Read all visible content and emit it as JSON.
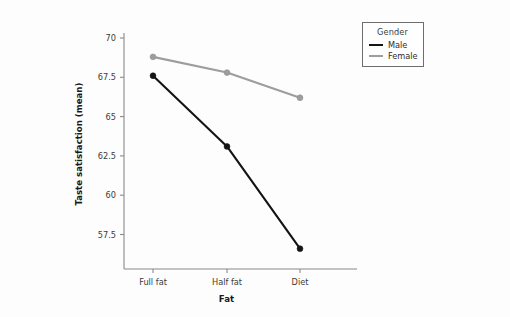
{
  "chart_data": {
    "type": "line",
    "title": "",
    "xlabel": "Fat",
    "ylabel": "Taste satisfaction (mean)",
    "categories": [
      "Full fat",
      "Half fat",
      "Diet"
    ],
    "yticks": [
      "57.5",
      "60",
      "62.5",
      "65",
      "67.5",
      "70"
    ],
    "ylim": [
      56.0,
      70.5
    ],
    "grid": false,
    "legend": {
      "title": "Gender",
      "position": "top-right-outside",
      "entries": [
        {
          "name": "Male",
          "color": "#141414"
        },
        {
          "name": "Female",
          "color": "#9d9d9d"
        }
      ]
    },
    "series": [
      {
        "name": "Male",
        "color": "#141414",
        "values": [
          67.6,
          63.1,
          56.6
        ]
      },
      {
        "name": "Female",
        "color": "#9d9d9d",
        "values": [
          68.8,
          67.8,
          66.2
        ]
      }
    ]
  }
}
